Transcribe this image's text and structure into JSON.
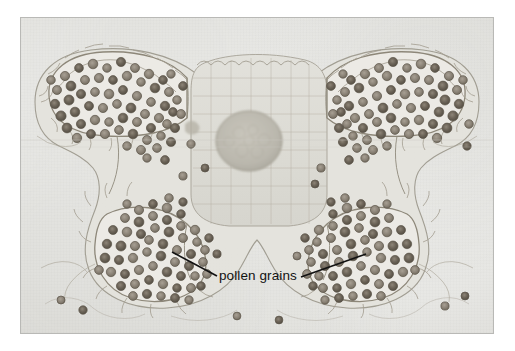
{
  "figure": {
    "kind": "light-micrograph",
    "plate": {
      "x": 21,
      "y": 18,
      "width": 472,
      "height": 315
    },
    "background_color": "#ffffff",
    "field_color": "#e9e9e6",
    "stain_color": "#6f6a60"
  },
  "annotations": {
    "label": "pollen grains",
    "label_color": "#121212",
    "leader_color": "#111111",
    "leaders": [
      {
        "name": "leader-left",
        "x1": 172,
        "y1": 252,
        "x2": 217,
        "y2": 276
      },
      {
        "name": "leader-right",
        "x1": 301,
        "y1": 277,
        "x2": 366,
        "y2": 254
      }
    ]
  },
  "structures": {
    "locules": [
      {
        "name": "upper-left-locule",
        "pollen_count": 62
      },
      {
        "name": "upper-right-locule",
        "pollen_count": 66
      },
      {
        "name": "lower-left-locule",
        "pollen_count": 58
      },
      {
        "name": "lower-right-locule",
        "pollen_count": 60
      }
    ],
    "connective": {
      "name": "connective-tissue"
    },
    "vascular_bundle": {
      "name": "vascular-bundle",
      "cx": 249,
      "cy": 143,
      "r": 31
    }
  },
  "pollen": {
    "fill": "#8c857a",
    "stroke": "#5e584e",
    "mean_diameter_px": 9
  }
}
